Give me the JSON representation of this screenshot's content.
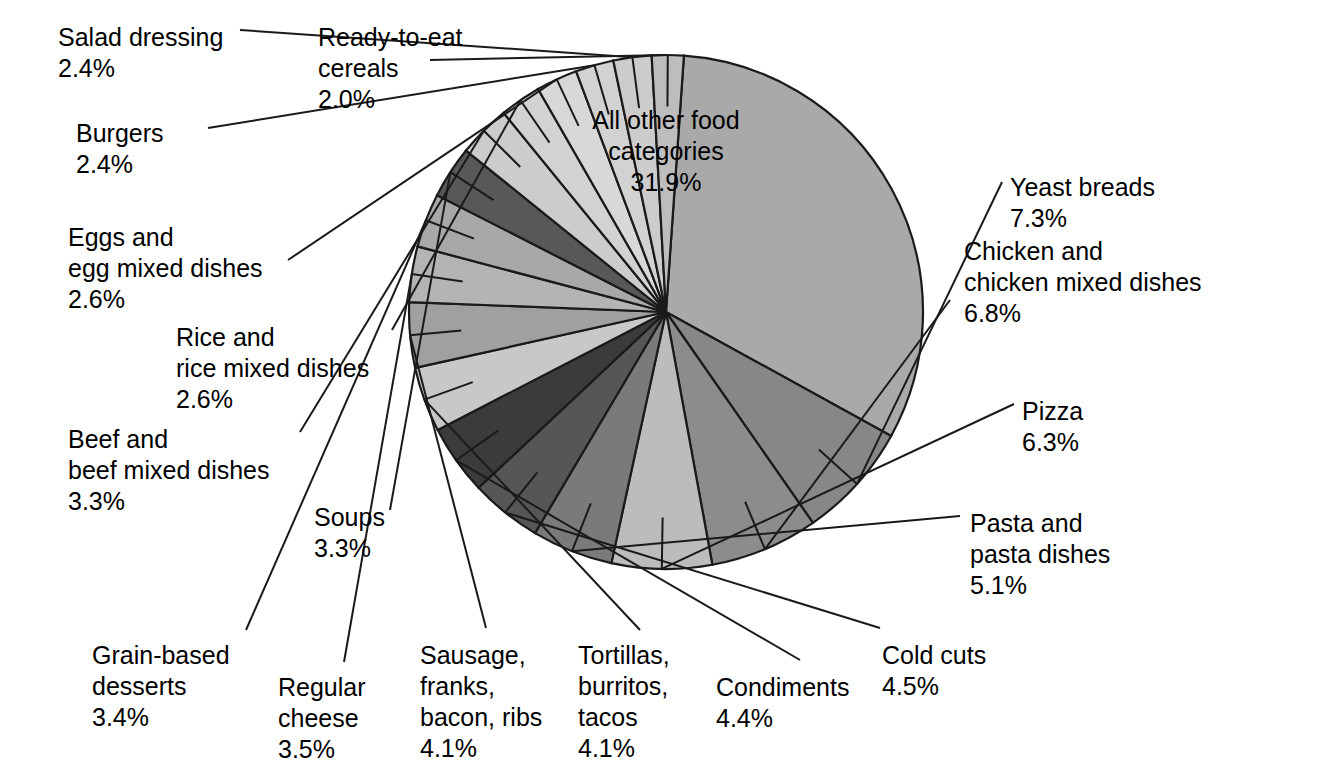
{
  "chart_data": {
    "type": "pie",
    "title": "",
    "xlabel": "",
    "ylabel": "",
    "legend_position": "none",
    "grid": false,
    "total_percent": 100.0,
    "value_unit": "%",
    "start_angle_deg": -86,
    "direction": "clockwise",
    "center": {
      "x": 666,
      "y": 312,
      "radius": 257
    },
    "categories": [
      "All other food categories",
      "Yeast breads",
      "Chicken and chicken mixed dishes",
      "Pizza",
      "Pasta and pasta dishes",
      "Cold cuts",
      "Condiments",
      "Tortillas, burritos, tacos",
      "Sausage, franks, bacon, ribs",
      "Regular cheese",
      "Grain-based desserts",
      "Soups",
      "Beef and beef mixed dishes",
      "Rice and rice mixed dishes",
      "Eggs and egg mixed dishes",
      "Burgers",
      "Salad dressing",
      "Ready-to-eat cereals"
    ],
    "values": [
      31.9,
      7.3,
      6.8,
      6.3,
      5.1,
      4.5,
      4.4,
      4.1,
      4.1,
      3.5,
      3.4,
      3.3,
      3.3,
      2.6,
      2.6,
      2.4,
      2.4,
      2.0
    ],
    "slice_colors": [
      "#a9a9a9",
      "#878787",
      "#8c8c8c",
      "#bcbcbc",
      "#7a7a7a",
      "#565656",
      "#3b3b3b",
      "#c8c8c8",
      "#a0a0a0",
      "#b4b4b4",
      "#a8a8a8",
      "#585858",
      "#cccccc",
      "#d2d2d2",
      "#d8d8d8",
      "#d2d2d2",
      "#cccccc",
      "#bdbdbd"
    ],
    "slice_labels": [
      {
        "name": "All other food categories",
        "value": "31.9%",
        "lines": [
          "All other food",
          "categories",
          "31.9%"
        ]
      },
      {
        "name": "Yeast breads",
        "value": "7.3%",
        "lines": [
          "Yeast breads",
          "7.3%"
        ]
      },
      {
        "name": "Chicken and chicken mixed dishes",
        "value": "6.8%",
        "lines": [
          "Chicken and",
          "chicken mixed dishes",
          "6.8%"
        ]
      },
      {
        "name": "Pizza",
        "value": "6.3%",
        "lines": [
          "Pizza",
          "6.3%"
        ]
      },
      {
        "name": "Pasta and pasta dishes",
        "value": "5.1%",
        "lines": [
          "Pasta and",
          "pasta dishes",
          "5.1%"
        ]
      },
      {
        "name": "Cold cuts",
        "value": "4.5%",
        "lines": [
          "Cold cuts",
          "4.5%"
        ]
      },
      {
        "name": "Condiments",
        "value": "4.4%",
        "lines": [
          "Condiments",
          "4.4%"
        ]
      },
      {
        "name": "Tortillas, burritos, tacos",
        "value": "4.1%",
        "lines": [
          "Tortillas,",
          "burritos,",
          "tacos",
          "4.1%"
        ]
      },
      {
        "name": "Sausage, franks, bacon, ribs",
        "value": "4.1%",
        "lines": [
          "Sausage,",
          "franks,",
          "bacon, ribs",
          "4.1%"
        ]
      },
      {
        "name": "Regular cheese",
        "value": "3.5%",
        "lines": [
          "Regular",
          "cheese",
          "3.5%"
        ]
      },
      {
        "name": "Grain-based desserts",
        "value": "3.4%",
        "lines": [
          "Grain-based",
          "desserts",
          "3.4%"
        ]
      },
      {
        "name": "Soups",
        "value": "3.3%",
        "lines": [
          "Soups",
          "3.3%"
        ]
      },
      {
        "name": "Beef and beef mixed dishes",
        "value": "3.3%",
        "lines": [
          "Beef and",
          "beef mixed dishes",
          "3.3%"
        ]
      },
      {
        "name": "Rice and rice mixed dishes",
        "value": "2.6%",
        "lines": [
          "Rice and",
          "rice mixed dishes",
          "2.6%"
        ]
      },
      {
        "name": "Eggs and egg mixed dishes",
        "value": "2.6%",
        "lines": [
          "Eggs and",
          "egg mixed dishes",
          "2.6%"
        ]
      },
      {
        "name": "Burgers",
        "value": "2.4%",
        "lines": [
          "Burgers",
          "2.4%"
        ]
      },
      {
        "name": "Salad dressing",
        "value": "2.4%",
        "lines": [
          "Salad dressing",
          "2.4%"
        ]
      },
      {
        "name": "Ready-to-eat cereals",
        "value": "2.0%",
        "lines": [
          "Ready-to-eat",
          "cereals",
          "2.0%"
        ]
      }
    ]
  },
  "labels": {
    "center_slice": {
      "text": "All other food\ncategories\n31.9%",
      "x": 666,
      "y": 105,
      "align": "center"
    },
    "salad_dressing": {
      "text": "Salad dressing\n2.4%",
      "x": 58,
      "y": 22,
      "align": "left"
    },
    "ready_to_eat_cereals": {
      "text": "Ready-to-eat\ncereals\n2.0%",
      "x": 318,
      "y": 22,
      "align": "left"
    },
    "burgers": {
      "text": "Burgers\n2.4%",
      "x": 76,
      "y": 118,
      "align": "left"
    },
    "eggs": {
      "text": "Eggs and\negg mixed dishes\n2.6%",
      "x": 68,
      "y": 222,
      "align": "left"
    },
    "rice": {
      "text": "Rice and\nrice mixed dishes\n2.6%",
      "x": 176,
      "y": 322,
      "align": "left"
    },
    "beef": {
      "text": "Beef and\nbeef mixed dishes\n3.3%",
      "x": 68,
      "y": 424,
      "align": "left"
    },
    "soups": {
      "text": "Soups\n3.3%",
      "x": 314,
      "y": 502,
      "align": "left"
    },
    "grain_based_desserts": {
      "text": "Grain-based\ndesserts\n3.4%",
      "x": 92,
      "y": 640,
      "align": "left"
    },
    "regular_cheese": {
      "text": "Regular\ncheese\n3.5%",
      "x": 278,
      "y": 672,
      "align": "left"
    },
    "sausage": {
      "text": "Sausage,\nfranks,\nbacon, ribs\n4.1%",
      "x": 420,
      "y": 640,
      "align": "left"
    },
    "tortillas": {
      "text": "Tortillas,\nburritos,\ntacos\n4.1%",
      "x": 578,
      "y": 640,
      "align": "left"
    },
    "condiments": {
      "text": "Condiments\n4.4%",
      "x": 716,
      "y": 672,
      "align": "left"
    },
    "cold_cuts": {
      "text": "Cold cuts\n4.5%",
      "x": 882,
      "y": 640,
      "align": "left"
    },
    "pasta": {
      "text": "Pasta and\npasta dishes\n5.1%",
      "x": 970,
      "y": 508,
      "align": "left"
    },
    "pizza": {
      "text": "Pizza\n6.3%",
      "x": 1022,
      "y": 396,
      "align": "left"
    },
    "chicken": {
      "text": "Chicken and\nchicken mixed dishes\n6.8%",
      "x": 964,
      "y": 236,
      "align": "left"
    },
    "yeast_breads": {
      "text": "Yeast breads\n7.3%",
      "x": 1010,
      "y": 172,
      "align": "left"
    }
  },
  "style": {
    "background": "#ffffff",
    "stroke": "#1a1a1a",
    "text_color": "#000000"
  }
}
